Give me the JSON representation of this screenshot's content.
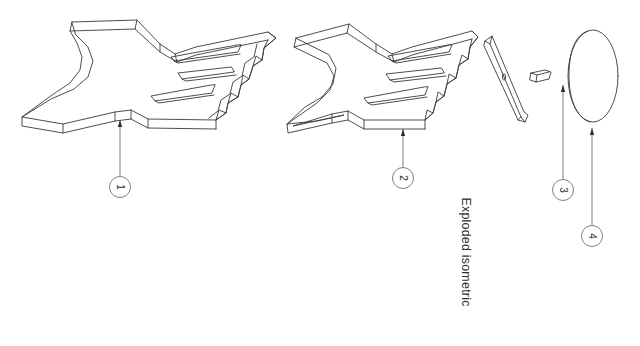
{
  "drawing": {
    "view_caption": "Exploded isometric",
    "background_color": "#ffffff",
    "line_color": "#3a3a3a",
    "leader_color": "#5a5a5a",
    "balloon_stroke_color": "#6a6a6a",
    "text_color": "#2f2f2f",
    "canvas": {
      "width": 640,
      "height": 346
    },
    "text_rotation_degrees": 90
  },
  "balloons": [
    {
      "number": "1",
      "cx": 120,
      "cy": 187,
      "r": 10.5,
      "leader_x": 120,
      "leader_top_y": 120,
      "leader_bottom_y": 176.5,
      "arrow_y": 120
    },
    {
      "number": "2",
      "cx": 403,
      "cy": 178,
      "r": 10.5,
      "leader_x": 403,
      "leader_top_y": 129,
      "leader_bottom_y": 167.5,
      "arrow_y": 129
    },
    {
      "number": "3",
      "cx": 563,
      "cy": 190,
      "r": 10.5,
      "leader_x": 563,
      "leader_top_y": 85,
      "leader_bottom_y": 179.5,
      "arrow_y": 85
    },
    {
      "number": "4",
      "cx": 592,
      "cy": 236,
      "r": 10.5,
      "leader_x": 592,
      "leader_top_y": 128,
      "leader_bottom_y": 225.5,
      "arrow_y": 128
    }
  ],
  "parts": [
    {
      "id": "1",
      "name": "bracket-assembly-left",
      "description": "Y-shaped forked bracket plate, assembled"
    },
    {
      "id": "2",
      "name": "bracket-body-right",
      "description": "Y-shaped forked bracket plate with detached rail"
    },
    {
      "id": "3",
      "name": "pin-fastener",
      "description": "Small cylindrical pin"
    },
    {
      "id": "4",
      "name": "oval-cover-disc",
      "description": "Thin elliptical cover disc"
    }
  ],
  "caption": {
    "x": 466,
    "y": 252
  }
}
